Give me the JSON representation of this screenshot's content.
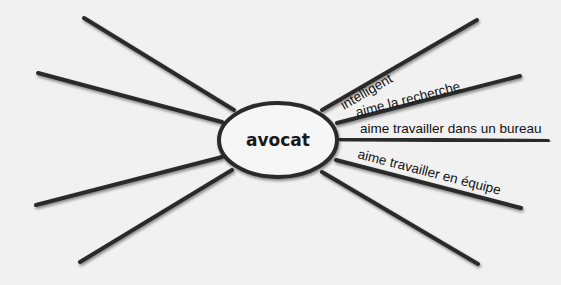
{
  "diagram": {
    "type": "mind-map",
    "center": {
      "label": "avocat",
      "cx": 278,
      "cy": 140,
      "rx": 59,
      "ry": 37
    },
    "spokes": [
      {
        "id": "r1",
        "x1": 322,
        "y1": 110,
        "x2": 477,
        "y2": 20,
        "label": "intelligent"
      },
      {
        "id": "r2",
        "x1": 337,
        "y1": 123,
        "x2": 520,
        "y2": 76,
        "label": "aime la recherche"
      },
      {
        "id": "r3",
        "x1": 340,
        "y1": 139,
        "x2": 548,
        "y2": 141,
        "label": "aime travailler dans un bureau"
      },
      {
        "id": "r4",
        "x1": 336,
        "y1": 160,
        "x2": 521,
        "y2": 208,
        "label": "aime travailler en équipe"
      },
      {
        "id": "r5",
        "x1": 322,
        "y1": 172,
        "x2": 478,
        "y2": 264,
        "label": ""
      },
      {
        "id": "l1",
        "x1": 234,
        "y1": 110,
        "x2": 84,
        "y2": 18,
        "label": ""
      },
      {
        "id": "l2",
        "x1": 222,
        "y1": 122,
        "x2": 38,
        "y2": 73,
        "label": ""
      },
      {
        "id": "l3",
        "x1": 218,
        "y1": 137,
        "x2": 10,
        "y2": 137,
        "label": ""
      },
      {
        "id": "l4",
        "x1": 222,
        "y1": 157,
        "x2": 36,
        "y2": 205,
        "label": ""
      },
      {
        "id": "l5",
        "x1": 232,
        "y1": 170,
        "x2": 80,
        "y2": 262,
        "label": ""
      }
    ],
    "colors": {
      "background": "#f1f1f1",
      "line": "#2a2a2a",
      "ellipse_fill": "#f6f6f6",
      "text": "#111111"
    }
  }
}
